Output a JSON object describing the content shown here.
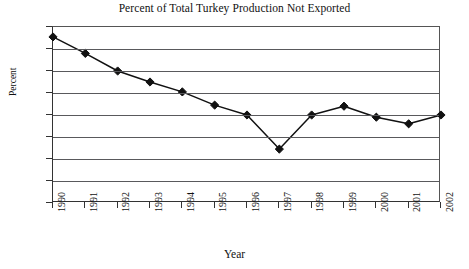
{
  "chart_data": {
    "type": "line",
    "title": "Percent of Total Turkey Production Not Exported",
    "xlabel": "Year",
    "ylabel": "Percent",
    "categories": [
      "1990",
      "1991",
      "1992",
      "1993",
      "1994",
      "1995",
      "1996",
      "1997",
      "1998",
      "1999",
      "2000",
      "2001",
      "2002"
    ],
    "x": [
      1990,
      1991,
      1992,
      1993,
      1994,
      1995,
      1996,
      1997,
      1998,
      1999,
      2000,
      2001,
      2002
    ],
    "values": [
      99.1,
      97.6,
      96.0,
      95.0,
      94.1,
      92.9,
      92.0,
      88.9,
      92.0,
      92.8,
      91.8,
      91.2,
      92.0
    ],
    "ylim": [
      84,
      100
    ],
    "ytick_values": [
      84,
      86,
      88,
      90,
      92,
      94,
      96,
      98,
      100
    ],
    "ytick_labels": [
      "84",
      "86",
      "88",
      "90",
      "92",
      "94",
      "96",
      "98",
      "100"
    ],
    "xlim": [
      1990,
      2002
    ],
    "grid": "horizontal",
    "legend": "none",
    "marker": "diamond",
    "line_color": "#111111",
    "marker_color": "#111111",
    "gridline_color": "#59595c",
    "axis_color": "#333333",
    "background_color": "#ffffff"
  }
}
